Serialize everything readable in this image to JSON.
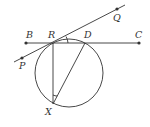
{
  "diagram": {
    "type": "geometry",
    "points": {
      "B": {
        "label": "B",
        "x": 26,
        "y": 43
      },
      "R": {
        "label": "R",
        "x": 53,
        "y": 43
      },
      "D": {
        "label": "D",
        "x": 85,
        "y": 43
      },
      "C": {
        "label": "C",
        "x": 139,
        "y": 43
      },
      "P": {
        "label": "P",
        "x": 22,
        "y": 58
      },
      "Q": {
        "label": "Q",
        "x": 117,
        "y": 9
      },
      "X": {
        "label": "X",
        "x": 53,
        "y": 104
      }
    },
    "circle": {
      "cx": 69,
      "cy": 73,
      "r": 34
    },
    "lines": [
      "BC",
      "PQ",
      "RX",
      "DX"
    ],
    "angle_marks": [
      "QRD",
      "RXD"
    ],
    "stroke_color": "#333333"
  }
}
